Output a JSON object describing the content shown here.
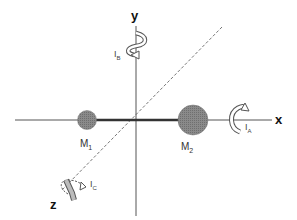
{
  "axes": {
    "x_label": "x",
    "y_label": "y",
    "z_label": "z"
  },
  "masses": [
    {
      "label": "M",
      "subscript": "1",
      "relative_size": "small"
    },
    {
      "label": "M",
      "subscript": "2",
      "relative_size": "large"
    }
  ],
  "moments_of_inertia": [
    {
      "label": "I",
      "subscript": "A",
      "axis": "x"
    },
    {
      "label": "I",
      "subscript": "B",
      "axis": "y"
    },
    {
      "label": "I",
      "subscript": "C",
      "axis": "z"
    }
  ],
  "colors": {
    "axis": "#444444",
    "rod": "#333333",
    "mass_fill": "#8a8a8a",
    "dashed_axis": "#777777",
    "arrow_fill": "#ffffff",
    "arrow_stroke": "#555555"
  }
}
